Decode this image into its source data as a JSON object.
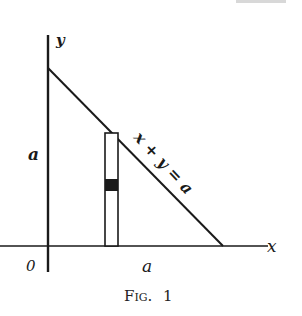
{
  "diagram": {
    "axes": {
      "y_label": "y",
      "x_label": "x",
      "origin_label": "0"
    },
    "labels": {
      "y_intercept": "a",
      "x_intercept": "a",
      "line_equation": "x + y = a"
    },
    "caption": {
      "prefix": "Fig.",
      "number": "1"
    },
    "colors": {
      "ink": "#1a1a1a",
      "background": "#ffffff"
    }
  }
}
